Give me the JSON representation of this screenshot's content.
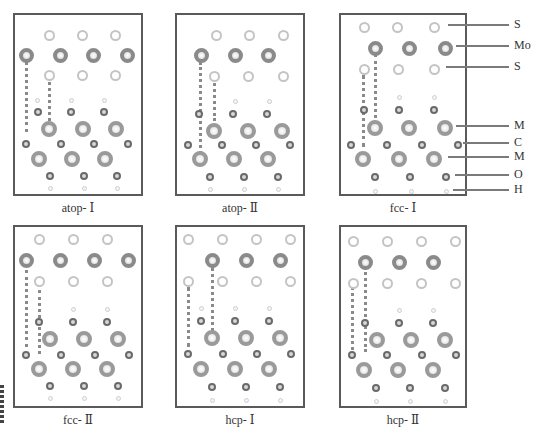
{
  "figure": {
    "panels": [
      {
        "id": "atop-I",
        "caption": "atop- Ⅰ",
        "box": [
          13,
          13,
          130,
          183
        ],
        "caption_y": 201,
        "dotlines": [
          [
            11,
            40,
            77
          ],
          [
            34,
            62,
            55
          ]
        ],
        "atoms": [
          [
            "S",
            34,
            20
          ],
          [
            "S",
            67,
            20
          ],
          [
            "S",
            100,
            20
          ],
          [
            "Mo",
            11,
            40
          ],
          [
            "Mo",
            45,
            40
          ],
          [
            "Mo",
            78,
            40
          ],
          [
            "Mo",
            112,
            40
          ],
          [
            "S",
            34,
            60
          ],
          [
            "S",
            67,
            60
          ],
          [
            "S",
            100,
            60
          ],
          [
            "H",
            22,
            85
          ],
          [
            "H",
            56,
            85
          ],
          [
            "H",
            89,
            85
          ],
          [
            "C",
            23,
            97
          ],
          [
            "C",
            56,
            97
          ],
          [
            "C",
            89,
            97
          ],
          [
            "M",
            34,
            114
          ],
          [
            "M",
            68,
            114
          ],
          [
            "M",
            101,
            114
          ],
          [
            "C",
            11,
            129
          ],
          [
            "C",
            46,
            129
          ],
          [
            "C",
            79,
            129
          ],
          [
            "C",
            113,
            129
          ],
          [
            "M",
            24,
            144
          ],
          [
            "M",
            57,
            144
          ],
          [
            "M",
            90,
            144
          ],
          [
            "C",
            35,
            161
          ],
          [
            "C",
            69,
            161
          ],
          [
            "C",
            102,
            161
          ],
          [
            "H",
            35,
            173
          ],
          [
            "H",
            69,
            173
          ],
          [
            "H",
            102,
            173
          ]
        ]
      },
      {
        "id": "atop-II",
        "caption": "atop- Ⅱ",
        "box": [
          175,
          13,
          130,
          183
        ],
        "caption_y": 201,
        "dotlines": [
          [
            23,
            47,
            92
          ],
          [
            37,
            63,
            43
          ]
        ],
        "atoms": [
          [
            "S",
            39,
            20
          ],
          [
            "S",
            72,
            20
          ],
          [
            "S",
            106,
            20
          ],
          [
            "Mo",
            24,
            40
          ],
          [
            "Mo",
            58,
            40
          ],
          [
            "Mo",
            91,
            40
          ],
          [
            "S",
            37,
            61
          ],
          [
            "S",
            71,
            61
          ],
          [
            "S",
            106,
            61
          ],
          [
            "H",
            58,
            86
          ],
          [
            "H",
            92,
            86
          ],
          [
            "C",
            22,
            99
          ],
          [
            "C",
            56,
            99
          ],
          [
            "C",
            90,
            99
          ],
          [
            "M",
            37,
            116
          ],
          [
            "M",
            71,
            116
          ],
          [
            "M",
            105,
            116
          ],
          [
            "C",
            11,
            130
          ],
          [
            "C",
            45,
            130
          ],
          [
            "C",
            79,
            130
          ],
          [
            "C",
            113,
            130
          ],
          [
            "M",
            23,
            144
          ],
          [
            "M",
            57,
            144
          ],
          [
            "M",
            91,
            144
          ],
          [
            "C",
            33,
            162
          ],
          [
            "C",
            67,
            162
          ],
          [
            "C",
            101,
            162
          ],
          [
            "H",
            33,
            174
          ],
          [
            "H",
            67,
            174
          ],
          [
            "H",
            101,
            174
          ]
        ]
      },
      {
        "id": "fcc-I",
        "caption": "fcc- Ⅰ",
        "box": [
          339,
          13,
          128,
          183
        ],
        "caption_y": 201,
        "dotlines": [
          [
            22,
            60,
            72
          ],
          [
            34,
            39,
            71
          ]
        ],
        "atoms": [
          [
            "S",
            23,
            12
          ],
          [
            "S",
            56,
            12
          ],
          [
            "S",
            93,
            12
          ],
          [
            "Mo",
            34,
            33
          ],
          [
            "Mo",
            68,
            33
          ],
          [
            "Mo",
            104,
            33
          ],
          [
            "S",
            23,
            54
          ],
          [
            "S",
            57,
            54
          ],
          [
            "S",
            93,
            54
          ],
          [
            "H",
            58,
            82
          ],
          [
            "H",
            93,
            82
          ],
          [
            "C",
            23,
            95
          ],
          [
            "C",
            58,
            95
          ],
          [
            "C",
            93,
            95
          ],
          [
            "M",
            34,
            113
          ],
          [
            "M",
            68,
            113
          ],
          [
            "M",
            104,
            113
          ],
          [
            "C",
            10,
            130
          ],
          [
            "C",
            46,
            130
          ],
          [
            "C",
            81,
            130
          ],
          [
            "C",
            117,
            130
          ],
          [
            "M",
            22,
            144
          ],
          [
            "M",
            58,
            144
          ],
          [
            "M",
            93,
            144
          ],
          [
            "C",
            34,
            162
          ],
          [
            "C",
            69,
            162
          ],
          [
            "C",
            105,
            162
          ],
          [
            "H",
            34,
            176
          ],
          [
            "H",
            70,
            176
          ],
          [
            "H",
            105,
            176
          ]
        ]
      },
      {
        "id": "fcc-II",
        "caption": "fcc- Ⅱ",
        "box": [
          13,
          225,
          130,
          183
        ],
        "caption_y": 413,
        "dotlines": [
          [
            11,
            43,
            77
          ],
          [
            24,
            63,
            64
          ]
        ],
        "atoms": [
          [
            "S",
            24,
            12
          ],
          [
            "S",
            58,
            12
          ],
          [
            "S",
            92,
            12
          ],
          [
            "Mo",
            11,
            33
          ],
          [
            "Mo",
            45,
            33
          ],
          [
            "Mo",
            79,
            33
          ],
          [
            "Mo",
            113,
            33
          ],
          [
            "S",
            24,
            54
          ],
          [
            "S",
            58,
            54
          ],
          [
            "S",
            92,
            54
          ],
          [
            "H",
            58,
            82
          ],
          [
            "H",
            92,
            82
          ],
          [
            "C",
            24,
            95
          ],
          [
            "C",
            58,
            95
          ],
          [
            "C",
            92,
            95
          ],
          [
            "M",
            35,
            112
          ],
          [
            "M",
            69,
            112
          ],
          [
            "M",
            103,
            112
          ],
          [
            "C",
            11,
            128
          ],
          [
            "C",
            46,
            128
          ],
          [
            "C",
            80,
            128
          ],
          [
            "C",
            114,
            128
          ],
          [
            "M",
            24,
            142
          ],
          [
            "M",
            58,
            142
          ],
          [
            "M",
            92,
            142
          ],
          [
            "C",
            35,
            159
          ],
          [
            "C",
            69,
            159
          ],
          [
            "C",
            103,
            159
          ],
          [
            "H",
            35,
            171
          ],
          [
            "H",
            69,
            171
          ],
          [
            "H",
            103,
            171
          ]
        ]
      },
      {
        "id": "hcp-I",
        "caption": "hcp- Ⅰ",
        "box": [
          175,
          225,
          130,
          183
        ],
        "caption_y": 413,
        "dotlines": [
          [
            11,
            60,
            60
          ],
          [
            35,
            40,
            72
          ]
        ],
        "atoms": [
          [
            "S",
            11,
            12
          ],
          [
            "S",
            45,
            12
          ],
          [
            "S",
            79,
            12
          ],
          [
            "S",
            113,
            12
          ],
          [
            "Mo",
            35,
            33
          ],
          [
            "Mo",
            69,
            33
          ],
          [
            "Mo",
            103,
            33
          ],
          [
            "S",
            11,
            54
          ],
          [
            "S",
            45,
            54
          ],
          [
            "S",
            79,
            54
          ],
          [
            "S",
            113,
            54
          ],
          [
            "H",
            24,
            81
          ],
          [
            "H",
            58,
            81
          ],
          [
            "H",
            92,
            81
          ],
          [
            "C",
            24,
            94
          ],
          [
            "C",
            58,
            94
          ],
          [
            "C",
            92,
            94
          ],
          [
            "M",
            35,
            111
          ],
          [
            "M",
            69,
            111
          ],
          [
            "M",
            103,
            111
          ],
          [
            "C",
            11,
            127
          ],
          [
            "C",
            46,
            127
          ],
          [
            "C",
            80,
            127
          ],
          [
            "C",
            114,
            127
          ],
          [
            "M",
            24,
            142
          ],
          [
            "M",
            58,
            142
          ],
          [
            "M",
            92,
            142
          ],
          [
            "C",
            35,
            160
          ],
          [
            "C",
            69,
            160
          ],
          [
            "C",
            103,
            160
          ],
          [
            "H",
            35,
            173
          ],
          [
            "H",
            69,
            173
          ],
          [
            "H",
            103,
            173
          ]
        ]
      },
      {
        "id": "hcp-II",
        "caption": "hcp- Ⅱ",
        "box": [
          339,
          225,
          128,
          183
        ],
        "caption_y": 413,
        "dotlines": [
          [
            11,
            60,
            63
          ],
          [
            24,
            40,
            85
          ]
        ],
        "atoms": [
          [
            "S",
            12,
            14
          ],
          [
            "S",
            46,
            14
          ],
          [
            "S",
            80,
            14
          ],
          [
            "S",
            114,
            14
          ],
          [
            "Mo",
            24,
            35
          ],
          [
            "Mo",
            58,
            35
          ],
          [
            "Mo",
            92,
            35
          ],
          [
            "S",
            12,
            56
          ],
          [
            "S",
            46,
            56
          ],
          [
            "S",
            80,
            56
          ],
          [
            "S",
            114,
            56
          ],
          [
            "H",
            58,
            83
          ],
          [
            "H",
            92,
            83
          ],
          [
            "C",
            24,
            96
          ],
          [
            "C",
            58,
            96
          ],
          [
            "C",
            92,
            96
          ],
          [
            "M",
            36,
            113
          ],
          [
            "M",
            70,
            113
          ],
          [
            "M",
            104,
            113
          ],
          [
            "C",
            11,
            128
          ],
          [
            "C",
            46,
            128
          ],
          [
            "C",
            81,
            128
          ],
          [
            "C",
            115,
            128
          ],
          [
            "M",
            23,
            143
          ],
          [
            "M",
            57,
            143
          ],
          [
            "M",
            92,
            143
          ],
          [
            "C",
            35,
            161
          ],
          [
            "C",
            69,
            161
          ],
          [
            "C",
            104,
            161
          ],
          [
            "H",
            35,
            174
          ],
          [
            "H",
            69,
            174
          ],
          [
            "H",
            104,
            174
          ]
        ]
      }
    ],
    "legend": {
      "x_label": 514,
      "items": [
        {
          "label": "S",
          "y": 25,
          "line_from": 448
        },
        {
          "label": "Mo",
          "y": 46,
          "line_from": 456
        },
        {
          "label": "S",
          "y": 67,
          "line_from": 446
        },
        {
          "label": "M",
          "y": 126,
          "line_from": 456
        },
        {
          "label": "C",
          "y": 143,
          "line_from": 463
        },
        {
          "label": "M",
          "y": 157,
          "line_from": 448
        },
        {
          "label": "O",
          "y": 175,
          "line_from": 455
        },
        {
          "label": "H",
          "y": 190,
          "line_from": 453
        }
      ],
      "line_to": 509
    }
  }
}
